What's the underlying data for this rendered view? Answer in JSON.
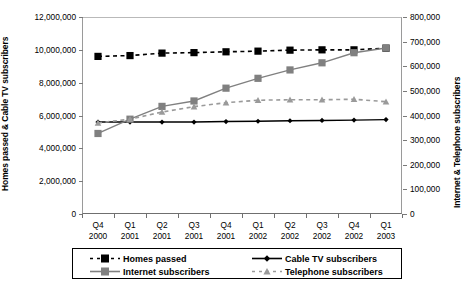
{
  "chart_data": {
    "type": "line",
    "title": "",
    "xlabel": "",
    "categories": [
      "Q4 2000",
      "Q1 2001",
      "Q2 2001",
      "Q3 2001",
      "Q4 2001",
      "Q1 2002",
      "Q2 2002",
      "Q3 2002",
      "Q4 2002",
      "Q1 2003"
    ],
    "category_lines": [
      [
        "Q4",
        "2000"
      ],
      [
        "Q1",
        "2001"
      ],
      [
        "Q2",
        "2001"
      ],
      [
        "Q3",
        "2001"
      ],
      [
        "Q4",
        "2001"
      ],
      [
        "Q1",
        "2002"
      ],
      [
        "Q2",
        "2002"
      ],
      [
        "Q3",
        "2002"
      ],
      [
        "Q4",
        "2002"
      ],
      [
        "Q1",
        "2003"
      ]
    ],
    "grid": false,
    "legend_position": "bottom",
    "axes": {
      "left": {
        "label": "Homes passed & Cable TV subscribers",
        "min": 0,
        "max": 12000000,
        "step": 2000000,
        "ticks": [
          "0",
          "2,000,000",
          "4,000,000",
          "6,000,000",
          "8,000,000",
          "10,000,000",
          "12,000,000"
        ]
      },
      "right": {
        "label": "Internet & Telephone subscribers",
        "min": 0,
        "max": 800000,
        "step": 100000,
        "ticks": [
          "0",
          "100,000",
          "200,000",
          "300,000",
          "400,000",
          "500,000",
          "600,000",
          "700,000",
          "800,000"
        ]
      }
    },
    "series": [
      {
        "name": "Homes passed",
        "axis": "left",
        "color": "#000000",
        "marker": "square",
        "dash": "dashed",
        "values": [
          9600000,
          9650000,
          9800000,
          9830000,
          9880000,
          9920000,
          9980000,
          10000000,
          10000000,
          10100000
        ]
      },
      {
        "name": "Cable TV subscribers",
        "axis": "left",
        "color": "#000000",
        "marker": "diamond",
        "dash": "solid",
        "values": [
          5600000,
          5600000,
          5600000,
          5600000,
          5630000,
          5650000,
          5680000,
          5700000,
          5720000,
          5750000
        ]
      },
      {
        "name": "Internet subscribers",
        "axis": "right",
        "color": "#808080",
        "marker": "square",
        "dash": "solid",
        "values": [
          327000,
          385000,
          437000,
          459000,
          511000,
          551000,
          585000,
          614000,
          655000,
          674000
        ]
      },
      {
        "name": "Telephone subscribers",
        "axis": "right",
        "color": "#9a9a9a",
        "marker": "triangle",
        "dash": "dashed",
        "values": [
          370000,
          385000,
          414000,
          436000,
          452000,
          462000,
          464000,
          464000,
          466000,
          456000
        ]
      }
    ]
  },
  "legend": {
    "items": [
      {
        "label": "Homes passed"
      },
      {
        "label": "Cable TV subscribers"
      },
      {
        "label": "Internet subscribers"
      },
      {
        "label": "Telephone subscribers"
      }
    ]
  }
}
